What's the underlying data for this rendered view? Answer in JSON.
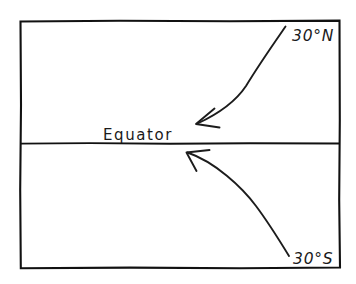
{
  "diagram": {
    "background_color": "#ffffff",
    "ink_color": "#1c1c1c",
    "frame": {
      "name": "map-frame-rectangle",
      "left": 20,
      "top": 21,
      "right": 340,
      "bottom": 268
    },
    "equator_line": {
      "name": "equator-line",
      "y": 143,
      "x_start": 20,
      "x_end": 340
    },
    "labels": {
      "north": "30°N",
      "equator": "Equator",
      "south": "30°S"
    },
    "arrows": [
      {
        "name": "arrow-from-30n-to-equator",
        "from_label": "30°N",
        "to_label": "Equator",
        "direction": "down-left",
        "tail_x": 285,
        "tail_y": 27,
        "tip_x": 196,
        "tip_y": 124
      },
      {
        "name": "arrow-from-30s-to-equator",
        "from_label": "30°S",
        "to_label": "Equator",
        "direction": "up-left",
        "tail_x": 289,
        "tail_y": 256,
        "tip_x": 186,
        "tip_y": 152
      }
    ]
  }
}
